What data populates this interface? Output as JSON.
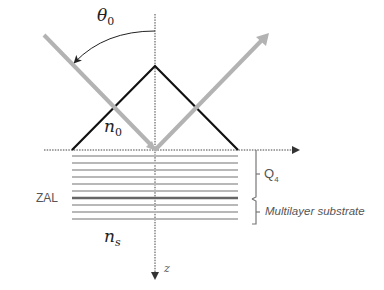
{
  "diagram": {
    "labels": {
      "theta": "θ",
      "theta_sub": "0",
      "n0": "n",
      "n0_sub": "0",
      "ns": "n",
      "ns_sub": "s",
      "z_axis": "z",
      "zal": "ZAL",
      "q4": "Q",
      "q4_sub": "4",
      "multilayer": "Multilayer substrate"
    },
    "colors": {
      "ray": "#b3b3b3",
      "prism": "#111111",
      "layer": "#b8b8b8",
      "zal_layer": "#666666",
      "axis": "#444444",
      "bracket": "#777777"
    },
    "layers": {
      "count": 10,
      "zal_index": 6
    }
  }
}
